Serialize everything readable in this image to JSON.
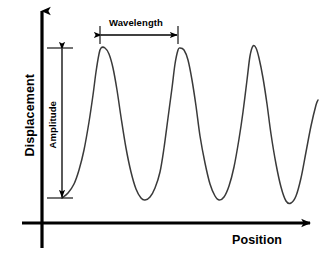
{
  "figure": {
    "kind": "wave-anatomy-diagram",
    "background_color": "#ffffff",
    "axis_color": "#000000",
    "wave_color": "#3a3a3a",
    "annotation_color": "#000000"
  },
  "axes": {
    "y_axis": {
      "label": "Displacement",
      "orientation": "vertical",
      "arrow": "up",
      "x": 42,
      "y_top": 8,
      "y_bottom": 248
    },
    "x_axis": {
      "label": "Position",
      "orientation": "horizontal",
      "arrow": "right",
      "y": 223,
      "x_left": 22,
      "x_right": 313
    }
  },
  "annotations": [
    {
      "name": "wavelength",
      "label": "Wavelength",
      "type": "double-headed-horizontal-arrow",
      "x_start": 100,
      "x_end": 178,
      "y": 35,
      "tick_top": 26,
      "tick_bottom": 44
    },
    {
      "name": "amplitude",
      "label": "Amplitude",
      "type": "double-headed-vertical-arrow",
      "x": 62,
      "y_top": 48,
      "y_bottom": 198,
      "tick_left": 47,
      "tick_right": 73
    }
  ],
  "chart_data": {
    "type": "line",
    "title": "",
    "xlabel": "Position",
    "ylabel": "Displacement",
    "grid": false,
    "legend": null,
    "annotations": [
      "Wavelength",
      "Amplitude"
    ],
    "wave": {
      "crests_x": [
        100,
        178,
        251
      ],
      "crests_y": [
        48,
        48,
        46
      ],
      "troughs_x": [
        143,
        215,
        285
      ],
      "troughs_y": [
        200,
        200,
        203
      ],
      "start_point": [
        62,
        198
      ],
      "end_point": [
        318,
        100
      ],
      "wavelength_px": 78,
      "amplitude_px": 150
    },
    "path_points": [
      [
        62,
        198
      ],
      [
        68,
        193
      ],
      [
        74,
        184
      ],
      [
        79,
        170
      ],
      [
        84,
        150
      ],
      [
        89,
        122
      ],
      [
        93,
        95
      ],
      [
        96,
        72
      ],
      [
        99,
        54
      ],
      [
        101,
        48
      ],
      [
        105,
        48
      ],
      [
        109,
        54
      ],
      [
        113,
        68
      ],
      [
        117,
        90
      ],
      [
        121,
        117
      ],
      [
        126,
        148
      ],
      [
        131,
        172
      ],
      [
        136,
        189
      ],
      [
        141,
        198
      ],
      [
        145,
        200
      ],
      [
        150,
        197
      ],
      [
        155,
        188
      ],
      [
        160,
        172
      ],
      [
        164,
        148
      ],
      [
        168,
        118
      ],
      [
        172,
        88
      ],
      [
        175,
        64
      ],
      [
        178,
        50
      ],
      [
        180,
        48
      ],
      [
        184,
        50
      ],
      [
        188,
        60
      ],
      [
        192,
        80
      ],
      [
        196,
        106
      ],
      [
        200,
        136
      ],
      [
        205,
        163
      ],
      [
        210,
        184
      ],
      [
        215,
        196
      ],
      [
        219,
        200
      ],
      [
        224,
        197
      ],
      [
        229,
        186
      ],
      [
        234,
        167
      ],
      [
        239,
        139
      ],
      [
        243,
        112
      ],
      [
        247,
        80
      ],
      [
        250,
        56
      ],
      [
        253,
        46
      ],
      [
        256,
        48
      ],
      [
        259,
        58
      ],
      [
        263,
        78
      ],
      [
        267,
        104
      ],
      [
        271,
        134
      ],
      [
        276,
        164
      ],
      [
        281,
        187
      ],
      [
        286,
        201
      ],
      [
        291,
        203
      ],
      [
        296,
        196
      ],
      [
        301,
        178
      ],
      [
        306,
        152
      ],
      [
        311,
        126
      ],
      [
        316,
        105
      ],
      [
        318,
        100
      ]
    ]
  }
}
